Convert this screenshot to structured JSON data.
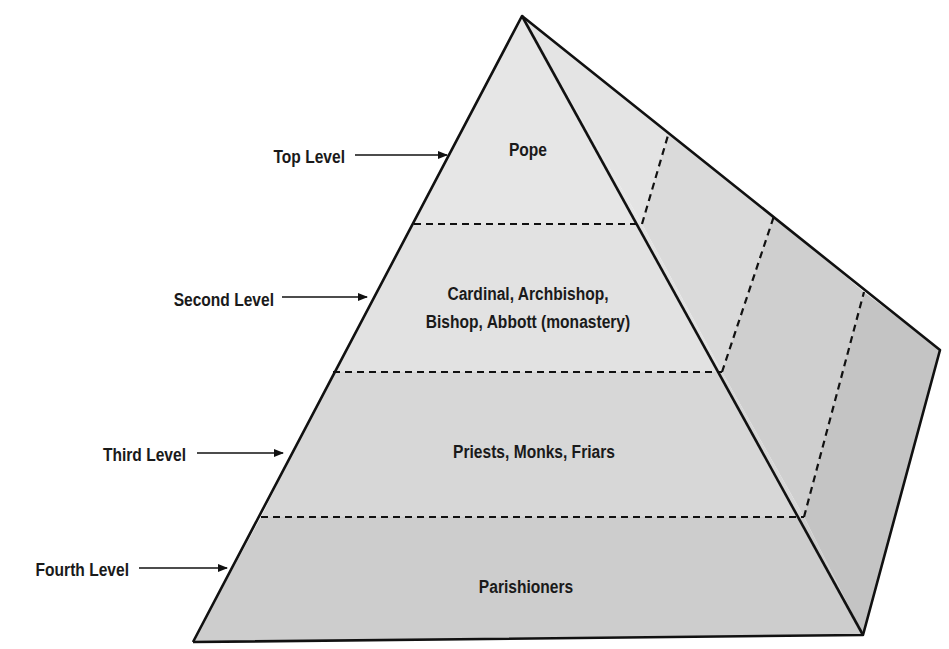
{
  "diagram": {
    "type": "hierarchy-pyramid",
    "colors": {
      "background": "#ffffff",
      "outline": "#111111",
      "front_level1": "#e6e6e6",
      "front_level2": "#e2e2e2",
      "front_level3": "#d7d7d7",
      "front_level4": "#cdcdcd",
      "side_band1": "#e4e4e4",
      "side_band2": "#dadada",
      "side_band3": "#cfcfcf",
      "side_band4": "#c4c4c4",
      "text": "#1a1a1a"
    },
    "levels": [
      {
        "side_label": "Top Level",
        "content": [
          "Pope"
        ]
      },
      {
        "side_label": "Second Level",
        "content": [
          "Cardinal, Archbishop,",
          "Bishop, Abbott (monastery)"
        ]
      },
      {
        "side_label": "Third Level",
        "content": [
          "Priests, Monks, Friars"
        ]
      },
      {
        "side_label": "Fourth Level",
        "content": [
          "Parishioners"
        ]
      }
    ]
  }
}
